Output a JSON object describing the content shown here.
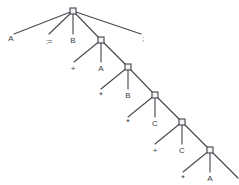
{
  "figure": {
    "type": "parse-tree",
    "width": 239,
    "height": 185,
    "background": "#ffffff",
    "edge_color": "#4a4a52",
    "node_fill": "#f4f4f4",
    "node_stroke": "#44444c",
    "label_color": "#3c3c44"
  },
  "nodes": [
    {
      "id": "n1",
      "x": 73,
      "y": 11,
      "size": 6
    },
    {
      "id": "n2",
      "x": 101,
      "y": 40,
      "size": 6
    },
    {
      "id": "n3",
      "x": 128,
      "y": 67,
      "size": 6
    },
    {
      "id": "n4",
      "x": 155,
      "y": 95,
      "size": 6
    },
    {
      "id": "n5",
      "x": 182,
      "y": 122,
      "size": 6
    },
    {
      "id": "n6",
      "x": 210,
      "y": 150,
      "size": 6
    }
  ],
  "edges": [
    {
      "from": "n1",
      "x1": 73,
      "y1": 11,
      "x2": 14,
      "y2": 34
    },
    {
      "from": "n1",
      "x1": 73,
      "y1": 11,
      "x2": 49,
      "y2": 34
    },
    {
      "from": "n1",
      "x1": 73,
      "y1": 11,
      "x2": 73,
      "y2": 34
    },
    {
      "from": "n1",
      "x1": 73,
      "y1": 11,
      "x2": 101,
      "y2": 40
    },
    {
      "from": "n1",
      "x1": 73,
      "y1": 11,
      "x2": 141,
      "y2": 34
    },
    {
      "from": "n2",
      "x1": 101,
      "y1": 40,
      "x2": 74,
      "y2": 62
    },
    {
      "from": "n2",
      "x1": 101,
      "y1": 40,
      "x2": 101,
      "y2": 62
    },
    {
      "from": "n2",
      "x1": 101,
      "y1": 40,
      "x2": 128,
      "y2": 67
    },
    {
      "from": "n3",
      "x1": 128,
      "y1": 67,
      "x2": 101,
      "y2": 89
    },
    {
      "from": "n3",
      "x1": 128,
      "y1": 67,
      "x2": 128,
      "y2": 89
    },
    {
      "from": "n3",
      "x1": 128,
      "y1": 67,
      "x2": 155,
      "y2": 95
    },
    {
      "from": "n4",
      "x1": 155,
      "y1": 95,
      "x2": 128,
      "y2": 117
    },
    {
      "from": "n4",
      "x1": 155,
      "y1": 95,
      "x2": 155,
      "y2": 117
    },
    {
      "from": "n4",
      "x1": 155,
      "y1": 95,
      "x2": 182,
      "y2": 122
    },
    {
      "from": "n5",
      "x1": 182,
      "y1": 122,
      "x2": 155,
      "y2": 144
    },
    {
      "from": "n5",
      "x1": 182,
      "y1": 122,
      "x2": 182,
      "y2": 144
    },
    {
      "from": "n5",
      "x1": 182,
      "y1": 122,
      "x2": 210,
      "y2": 150
    },
    {
      "from": "n6",
      "x1": 210,
      "y1": 150,
      "x2": 183,
      "y2": 172
    },
    {
      "from": "n6",
      "x1": 210,
      "y1": 150,
      "x2": 210,
      "y2": 172
    },
    {
      "from": "n6",
      "x1": 210,
      "y1": 150,
      "x2": 238,
      "y2": 178
    }
  ],
  "leaves": [
    {
      "id": "l-a-1",
      "text": "A",
      "x": 11,
      "y": 38,
      "kind": "ident"
    },
    {
      "id": "l-assign",
      "text": ":=",
      "x": 49,
      "y": 41,
      "kind": "assign"
    },
    {
      "id": "l-b-1",
      "text": "B",
      "x": 73,
      "y": 40,
      "kind": "ident"
    },
    {
      "id": "l-semi",
      "text": ";",
      "x": 143,
      "y": 38,
      "kind": "semi"
    },
    {
      "id": "l-plus-1",
      "text": "+",
      "x": 73,
      "y": 68,
      "kind": "op"
    },
    {
      "id": "l-a-2",
      "text": "A",
      "x": 101,
      "y": 68,
      "kind": "ident"
    },
    {
      "id": "l-star-1",
      "text": "*",
      "x": 101,
      "y": 95,
      "kind": "star"
    },
    {
      "id": "l-b-2",
      "text": "B",
      "x": 128,
      "y": 95,
      "kind": "ident"
    },
    {
      "id": "l-star-2",
      "text": "*",
      "x": 128,
      "y": 122,
      "kind": "star"
    },
    {
      "id": "l-c-1",
      "text": "C",
      "x": 155,
      "y": 123,
      "kind": "ident"
    },
    {
      "id": "l-plus-2",
      "text": "+",
      "x": 155,
      "y": 150,
      "kind": "op"
    },
    {
      "id": "l-c-2",
      "text": "C",
      "x": 182,
      "y": 150,
      "kind": "ident"
    },
    {
      "id": "l-star-3",
      "text": "*",
      "x": 183,
      "y": 178,
      "kind": "star"
    },
    {
      "id": "l-a-3",
      "text": "A",
      "x": 210,
      "y": 178,
      "kind": "ident"
    }
  ]
}
